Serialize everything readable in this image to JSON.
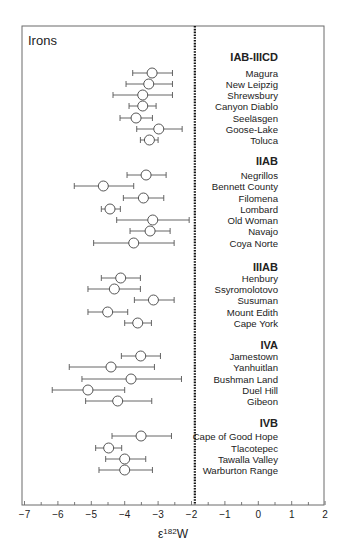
{
  "chart_data": {
    "type": "scatter",
    "title": "Irons",
    "xlabel": "ε182W",
    "xlabel_base": "ε",
    "xlabel_sup": "182",
    "xlabel_tail": "W",
    "ylabel": "",
    "xlim": [
      -7,
      2
    ],
    "xticks": [
      -7,
      -6,
      -5,
      -4,
      -3,
      -2,
      -1,
      0,
      1,
      2
    ],
    "xtick_labels": [
      "−7",
      "−6",
      "−5",
      "−4",
      "−3",
      "−2",
      "−1",
      "0",
      "1",
      "2"
    ],
    "grid": false,
    "legend": "none",
    "reference_line": {
      "x": -1.9,
      "style": "dotted"
    },
    "groups": [
      {
        "name": "IAB-IIICD",
        "y": 57,
        "samples": [
          {
            "name": "Magura",
            "y": 73,
            "value": -3.18,
            "lo": -3.76,
            "hi": -2.57
          },
          {
            "name": "New Leipzig",
            "y": 84,
            "value": -3.28,
            "lo": -3.96,
            "hi": -2.57
          },
          {
            "name": "Shrewsbury",
            "y": 95,
            "value": -3.46,
            "lo": -4.35,
            "hi": -2.57
          },
          {
            "name": "Canyon Diablo",
            "y": 106,
            "value": -3.46,
            "lo": -3.87,
            "hi": -3.06
          },
          {
            "name": "Seeläsgen",
            "y": 118,
            "value": -3.66,
            "lo": -4.14,
            "hi": -3.17
          },
          {
            "name": "Goose-Lake",
            "y": 129,
            "value": -2.98,
            "lo": -3.64,
            "hi": -2.28
          },
          {
            "name": "Toluca",
            "y": 140,
            "value": -3.26,
            "lo": -3.53,
            "hi": -3.0
          }
        ]
      },
      {
        "name": "IIAB",
        "y": 161,
        "samples": [
          {
            "name": "Negrillos",
            "y": 175,
            "value": -3.36,
            "lo": -3.93,
            "hi": -2.76
          },
          {
            "name": "Bennett County",
            "y": 186,
            "value": -4.64,
            "lo": -5.51,
            "hi": -3.73
          },
          {
            "name": "Filomena",
            "y": 198,
            "value": -3.44,
            "lo": -4.04,
            "hi": -2.83
          },
          {
            "name": "Lombard",
            "y": 209,
            "value": -4.44,
            "lo": -4.7,
            "hi": -4.13
          },
          {
            "name": "Old Woman",
            "y": 220,
            "value": -3.16,
            "lo": -4.24,
            "hi": -2.07
          },
          {
            "name": "Navajo",
            "y": 231,
            "value": -3.24,
            "lo": -3.84,
            "hi": -2.64
          },
          {
            "name": "Coya Norte",
            "y": 243,
            "value": -3.73,
            "lo": -4.93,
            "hi": -2.52
          }
        ]
      },
      {
        "name": "IIIAB",
        "y": 267,
        "samples": [
          {
            "name": "Henbury",
            "y": 278,
            "value": -4.12,
            "lo": -4.7,
            "hi": -3.53
          },
          {
            "name": "Ssyromolotovo",
            "y": 289,
            "value": -4.31,
            "lo": -5.1,
            "hi": -3.53
          },
          {
            "name": "Susuman",
            "y": 300,
            "value": -3.14,
            "lo": -3.71,
            "hi": -2.52
          },
          {
            "name": "Mount Edith",
            "y": 312,
            "value": -4.51,
            "lo": -5.1,
            "hi": -3.91
          },
          {
            "name": "Cape York",
            "y": 323,
            "value": -3.61,
            "lo": -4.0,
            "hi": -3.2
          }
        ]
      },
      {
        "name": "IVA",
        "y": 345,
        "samples": [
          {
            "name": "Jamestown",
            "y": 356,
            "value": -3.52,
            "lo": -4.1,
            "hi": -2.93
          },
          {
            "name": "Yanhuitlan",
            "y": 367,
            "value": -4.41,
            "lo": -5.66,
            "hi": -3.11
          },
          {
            "name": "Bushman Land",
            "y": 379,
            "value": -3.81,
            "lo": -5.28,
            "hi": -2.3
          },
          {
            "name": "Duel Hill",
            "y": 390,
            "value": -5.1,
            "lo": -6.17,
            "hi": -4.0
          },
          {
            "name": "Gibeon",
            "y": 401,
            "value": -4.21,
            "lo": -5.17,
            "hi": -3.19
          }
        ]
      },
      {
        "name": "IVB",
        "y": 423,
        "samples": [
          {
            "name": "Cape of Good Hope",
            "y": 436,
            "value": -3.51,
            "lo": -4.38,
            "hi": -2.6
          },
          {
            "name": "Tlacotepec",
            "y": 448,
            "value": -4.48,
            "lo": -4.87,
            "hi": -4.09
          },
          {
            "name": "Tawalla Valley",
            "y": 459,
            "value": -4.0,
            "lo": -4.57,
            "hi": -3.37
          },
          {
            "name": "Warburton Range",
            "y": 470,
            "value": -4.0,
            "lo": -4.77,
            "hi": -3.17
          }
        ]
      }
    ]
  },
  "style": {
    "frame_color": "#6b6b6b",
    "line_color": "#555555",
    "marker_fill": "#ffffff",
    "marker_stroke": "#444444",
    "reference_color": "#111111",
    "text_color": "#222222"
  }
}
